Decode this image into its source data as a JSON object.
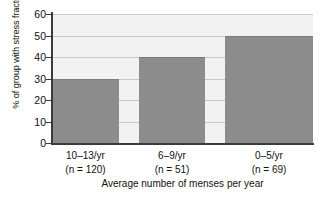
{
  "chart_data": {
    "type": "bar",
    "title": "",
    "xlabel": "Average number of menses per year",
    "ylabel": "% of group with stress fractures",
    "categories": [
      "10–13/yr",
      "6–9/yr",
      "0–5/yr"
    ],
    "category_sublabels": [
      "(n = 120)",
      "(n = 51)",
      "(n = 69)"
    ],
    "values": [
      30,
      40,
      50
    ],
    "ylim": [
      0,
      60
    ],
    "yticks": [
      0,
      10,
      20,
      30,
      40,
      50,
      60
    ],
    "ytick_labels": [
      "0",
      "10",
      "20",
      "30",
      "40",
      "50",
      "60"
    ],
    "grid": true,
    "grid_axis": "y",
    "legend": "none",
    "bar_color": "#8c8c8c",
    "plot_background": "#f2f2f2",
    "axis_color": "#3a3a3a",
    "gridline_color": "#c9c9c9"
  }
}
